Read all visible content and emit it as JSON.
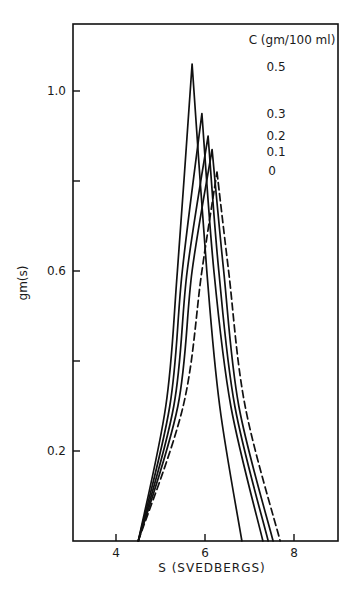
{
  "chart_data": {
    "type": "line",
    "title": "",
    "xlabel": "S (SVEDBERGS)",
    "ylabel": "gm(s)",
    "xlim": [
      3.2,
      9.0
    ],
    "ylim": [
      0.0,
      1.15
    ],
    "xticks": [
      4,
      6,
      8
    ],
    "xtick_labels": [
      "4",
      "6",
      "8"
    ],
    "yticks": [
      0.2,
      0.4,
      0.6,
      0.8,
      1.0
    ],
    "ytick_labels": [
      "0.2",
      "",
      "0.6",
      "",
      "1.0"
    ],
    "grid": false,
    "legend": {
      "title": "C (gm/100 ml)",
      "position": "upper right",
      "entries": [
        "0.5",
        "0.3",
        "0.2",
        "0.1",
        "0"
      ]
    },
    "series": [
      {
        "name": "0.5",
        "style": "solid",
        "x": [
          4.5,
          5.12,
          5.38,
          5.71,
          6.04,
          6.33,
          6.83
        ],
        "y": [
          0.0,
          0.3,
          0.6,
          1.06,
          0.6,
          0.3,
          0.0
        ]
      },
      {
        "name": "0.3",
        "style": "solid",
        "x": [
          4.5,
          5.21,
          5.49,
          5.93,
          6.2,
          6.58,
          7.3
        ],
        "y": [
          0.0,
          0.3,
          0.6,
          0.95,
          0.6,
          0.3,
          0.0
        ]
      },
      {
        "name": "0.2",
        "style": "solid",
        "x": [
          4.5,
          5.3,
          5.6,
          6.07,
          6.31,
          6.67,
          7.42
        ],
        "y": [
          0.0,
          0.3,
          0.6,
          0.9,
          0.6,
          0.3,
          0.0
        ]
      },
      {
        "name": "0.1",
        "style": "solid",
        "x": [
          4.5,
          5.39,
          5.71,
          6.16,
          6.42,
          6.76,
          7.53
        ],
        "y": [
          0.0,
          0.3,
          0.6,
          0.87,
          0.6,
          0.3,
          0.0
        ]
      },
      {
        "name": "0",
        "style": "dashed",
        "x": [
          4.5,
          5.51,
          5.93,
          6.27,
          6.53,
          6.9,
          7.69
        ],
        "y": [
          0.0,
          0.3,
          0.6,
          0.82,
          0.6,
          0.3,
          0.0
        ]
      }
    ]
  },
  "colors": {
    "line": "#111111",
    "background": "#ffffff"
  }
}
